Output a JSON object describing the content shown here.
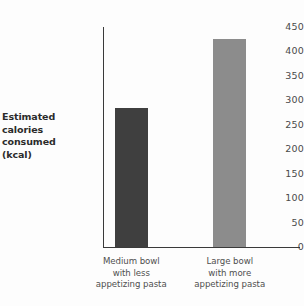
{
  "chart_data": {
    "type": "bar",
    "title": "",
    "subtitle": "",
    "xlabel": "",
    "ylabel": "Estimated calories consumed (kcal)",
    "ylabel_lines": [
      "Estimated",
      "calories",
      "consumed",
      "(kcal)"
    ],
    "categories": [
      "Medium bowl with less appetizing pasta",
      "Large bowl with more appetizing pasta"
    ],
    "category_lines": [
      [
        "Medium bowl",
        "with less",
        "appetizing pasta"
      ],
      [
        "Large bowl",
        "with more",
        "appetizing pasta"
      ]
    ],
    "values": [
      285,
      425
    ],
    "ylim": [
      0,
      450
    ],
    "yticks": [
      0,
      50,
      100,
      150,
      200,
      250,
      300,
      350,
      400,
      450
    ],
    "ytick_labels": [
      "0",
      "50",
      "100",
      "150",
      "200",
      "250",
      "300",
      "350",
      "400",
      "450"
    ],
    "grid": false,
    "legend": false,
    "legend_position": "none",
    "bar_colors": [
      "#3f3f3f",
      "#8c8c8c"
    ],
    "axis_color": "#3a3a3a",
    "tick_label_color": "#4a4a4a",
    "axis_title_color": "#2b2b2b",
    "background_color": "#fdfdfd"
  }
}
